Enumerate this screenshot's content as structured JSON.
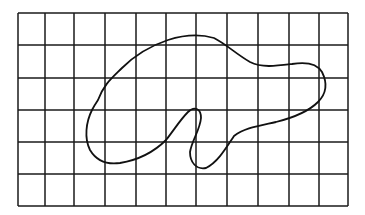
{
  "diagram": {
    "type": "grid-with-closed-curve",
    "grid": {
      "columns": 11,
      "rows": 6,
      "x_lines": [
        18,
        45,
        74,
        105,
        136,
        166,
        196,
        227,
        258,
        289,
        319,
        348
      ],
      "y_lines": [
        13,
        45,
        78,
        110,
        142,
        174,
        206
      ],
      "line_color": "#1a1a1a"
    },
    "shape": {
      "description": "irregular closed blob outline overlaid on grid",
      "stroke_color": "#111111",
      "path": "M 98 100 C 104 84, 112 78, 122 68 C 134 56, 150 46, 168 40 C 184 35, 200 34, 214 38 C 226 44, 236 54, 250 62 C 262 68, 276 66, 292 64 C 304 62, 316 62, 322 72 C 328 84, 326 94, 318 102 C 308 112, 292 118, 276 122 C 258 126, 244 128, 234 136 C 226 148, 218 162, 206 168 C 196 170, 190 162, 190 152 C 192 140, 200 130, 201 118 C 201 108, 194 106, 188 112 C 180 120, 174 130, 166 140 C 154 152, 138 160, 120 163 C 106 165, 96 160, 90 150 C 84 138, 86 122, 92 110 C 94 106, 96 103, 98 100 Z"
    }
  }
}
